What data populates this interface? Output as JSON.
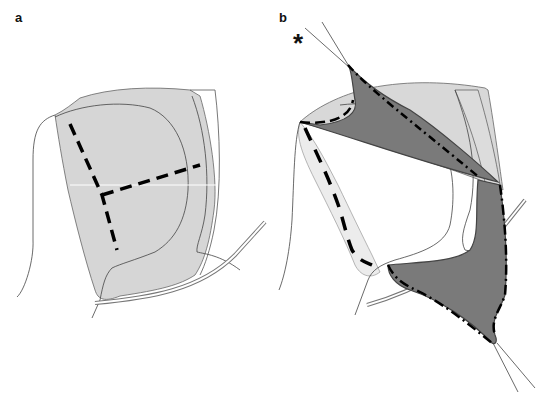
{
  "figure": {
    "panels": [
      {
        "label": "a",
        "description": "Shaded region with Y-shaped dashed lines"
      },
      {
        "label": "b",
        "description": "Shaded region with dark triangular zones and dashed outlines"
      }
    ],
    "annotation": "*",
    "colors": {
      "light_fill": "#d6d6d6",
      "pale_fill": "#ececec",
      "dark_fill": "#7a7a7a",
      "outline": "#555555",
      "dash": "#000000"
    }
  }
}
